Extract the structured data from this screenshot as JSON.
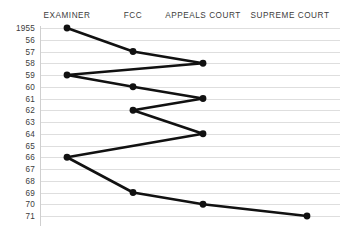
{
  "chart_data": {
    "type": "line",
    "title": "",
    "subtitle": "",
    "xlabel": "",
    "ylabel": "",
    "grid": true,
    "legend": false,
    "orientation": "vertical-time-axis",
    "categories": [
      "EXAMINER",
      "FCC",
      "APPEALS COURT",
      "SUPREME COURT"
    ],
    "category_x_px": [
      67,
      133,
      203,
      307
    ],
    "y_tick_labels": [
      "1955",
      "56",
      "57",
      "58",
      "59",
      "60",
      "61",
      "62",
      "63",
      "64",
      "65",
      "66",
      "67",
      "68",
      "69",
      "70",
      "71"
    ],
    "y_values": [
      1955,
      1956,
      1957,
      1958,
      1959,
      1960,
      1961,
      1962,
      1963,
      1964,
      1965,
      1966,
      1967,
      1968,
      1969,
      1970,
      1971
    ],
    "ylim": [
      1955,
      1971
    ],
    "points": [
      {
        "year": 1955,
        "year_label": "1955",
        "stage": "EXAMINER"
      },
      {
        "year": 1957,
        "year_label": "57",
        "stage": "FCC"
      },
      {
        "year": 1958,
        "year_label": "58",
        "stage": "APPEALS COURT"
      },
      {
        "year": 1959,
        "year_label": "59",
        "stage": "EXAMINER"
      },
      {
        "year": 1960,
        "year_label": "60",
        "stage": "FCC"
      },
      {
        "year": 1961,
        "year_label": "61",
        "stage": "APPEALS COURT"
      },
      {
        "year": 1962,
        "year_label": "62",
        "stage": "FCC"
      },
      {
        "year": 1964,
        "year_label": "64",
        "stage": "APPEALS COURT"
      },
      {
        "year": 1966,
        "year_label": "66",
        "stage": "EXAMINER"
      },
      {
        "year": 1969,
        "year_label": "69",
        "stage": "FCC"
      },
      {
        "year": 1970,
        "year_label": "70",
        "stage": "APPEALS COURT"
      },
      {
        "year": 1971,
        "year_label": "71",
        "stage": "SUPREME COURT"
      }
    ],
    "series": [
      {
        "name": "case-path",
        "x": [
          "EXAMINER",
          "FCC",
          "APPEALS COURT",
          "EXAMINER",
          "FCC",
          "APPEALS COURT",
          "FCC",
          "APPEALS COURT",
          "EXAMINER",
          "FCC",
          "APPEALS COURT",
          "SUPREME COURT"
        ],
        "values": [
          1955,
          1957,
          1958,
          1959,
          1960,
          1961,
          1962,
          1964,
          1966,
          1969,
          1970,
          1971
        ],
        "color": "#111111"
      }
    ]
  },
  "headers": {
    "examiner": "EXAMINER",
    "fcc": "FCC",
    "appeals_court": "APPEALS COURT",
    "supreme_court": "SUPREME COURT"
  },
  "caption": {
    "sliver_text": ""
  },
  "colors": {
    "line": "#111111",
    "marker": "#111111",
    "gridline": "#dedede",
    "axis_rule": "#cfcfcf",
    "text": "#3c3c3c",
    "background": "#ffffff"
  }
}
